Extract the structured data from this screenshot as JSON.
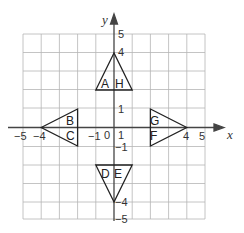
{
  "diagram": {
    "type": "coordinate-grid",
    "x_range": [
      -5,
      5
    ],
    "y_range": [
      -5,
      5
    ],
    "axis_labels": {
      "x": "x",
      "y": "y"
    },
    "x_tick_labels": [
      {
        "value": -5,
        "text": "−5"
      },
      {
        "value": -4,
        "text": "−4"
      },
      {
        "value": -1,
        "text": "−1"
      },
      {
        "value": 0,
        "text": "0"
      },
      {
        "value": 1,
        "text": "1"
      },
      {
        "value": 4,
        "text": "4"
      },
      {
        "value": 5,
        "text": "5"
      }
    ],
    "y_tick_labels": [
      {
        "value": 5,
        "text": "5"
      },
      {
        "value": 4,
        "text": "4"
      },
      {
        "value": 1,
        "text": "1"
      },
      {
        "value": -1,
        "text": "−1"
      },
      {
        "value": -4,
        "text": "−4"
      },
      {
        "value": -5,
        "text": "−5"
      }
    ],
    "triangles": [
      {
        "name": "top",
        "vertices": [
          [
            0,
            4
          ],
          [
            -1,
            2
          ],
          [
            1,
            2
          ]
        ],
        "labels": [
          "A",
          "H"
        ]
      },
      {
        "name": "left",
        "vertices": [
          [
            -4,
            0
          ],
          [
            -1,
            1
          ],
          [
            -1,
            -1
          ]
        ],
        "labels": [
          "B",
          "C"
        ]
      },
      {
        "name": "right",
        "vertices": [
          [
            4,
            0
          ],
          [
            2,
            1
          ],
          [
            2,
            -1
          ]
        ],
        "labels": [
          "G",
          "F"
        ]
      },
      {
        "name": "bottom",
        "vertices": [
          [
            0,
            -4
          ],
          [
            -1,
            -2
          ],
          [
            1,
            -2
          ]
        ],
        "labels": [
          "D",
          "E"
        ]
      }
    ],
    "colors": {
      "grid": "#b5b5b5",
      "axis": "#444444",
      "triangle": "#222222"
    }
  }
}
